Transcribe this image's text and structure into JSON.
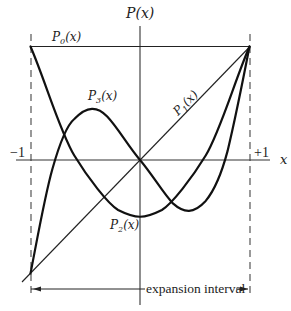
{
  "diagram": {
    "axis_labels": {
      "y": "P(x)",
      "x": "x"
    },
    "tick_labels": {
      "left": "−1",
      "right": "+1"
    },
    "curve_labels": {
      "p0": {
        "base": "P",
        "sub": "0",
        "arg": "(x)"
      },
      "p1": {
        "base": "P",
        "sub": "1",
        "arg": "(x)"
      },
      "p2": {
        "base": "P",
        "sub": "2",
        "arg": "(x)"
      },
      "p3": {
        "base": "P",
        "sub": "3",
        "arg": "(x)"
      }
    },
    "interval_label": "expansion interval",
    "colors": {
      "ink": "#111111",
      "axis": "#333333",
      "dash": "#555555",
      "background": "#ffffff"
    }
  }
}
